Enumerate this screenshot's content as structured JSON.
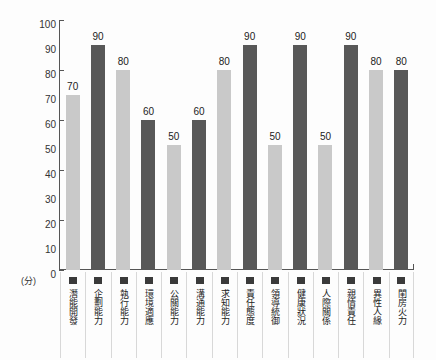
{
  "chart_data": {
    "type": "bar",
    "title": "",
    "xlabel": "",
    "ylabel": "(分)",
    "unit_label": "(分)",
    "ylim": [
      0,
      100
    ],
    "y_ticks": [
      100,
      90,
      80,
      70,
      60,
      50,
      40,
      30,
      20,
      10,
      0
    ],
    "y_tick_marks": [
      100,
      80,
      60,
      40,
      20,
      0
    ],
    "grid": false,
    "legend_position": "bottom-inline",
    "categories": [
      "潛能開發",
      "企劃能力",
      "執行能力",
      "環境適應",
      "公關能力",
      "溝通能力",
      "求知能力",
      "責任態度",
      "領導統御",
      "健康狀況",
      "人際關係",
      "親情責任",
      "異性人緣",
      "閨房火力"
    ],
    "values": [
      70,
      90,
      80,
      60,
      50,
      60,
      80,
      90,
      50,
      90,
      50,
      90,
      80,
      80
    ],
    "bar_styles": [
      "light",
      "dark",
      "light",
      "dark",
      "light",
      "dark",
      "light",
      "dark",
      "light",
      "dark",
      "light",
      "dark",
      "light",
      "dark"
    ],
    "colors": {
      "light_bar": "#c9c9c9",
      "dark_bar": "#585858",
      "axis": "#555555",
      "text": "#222222",
      "swatch": "#3a3a3a",
      "background": "#fdfdfd",
      "cell_divider": "#d8d8d8"
    }
  }
}
